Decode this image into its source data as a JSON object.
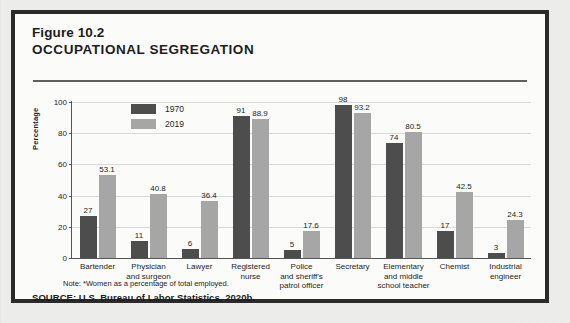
{
  "figure": {
    "number": "Figure 10.2",
    "title": "OCCUPATIONAL SEGREGATION",
    "note": "Note: *Women as a percentage of total employed.",
    "source": "SOURCE: U.S. Bureau of Labor Statistics, 2020b."
  },
  "colors": {
    "series_1970": "#4d4d4d",
    "series_2019": "#a6a6a6",
    "frame": "#2b2b2b",
    "gridline": "#d8d8d8",
    "text": "#1d1d1d",
    "panel_background": "#fbfbfa",
    "page_background": "#ececeb"
  },
  "legend": {
    "position": "inside-top-left",
    "entries": [
      {
        "label": "1970",
        "swatch": "#4d4d4d"
      },
      {
        "label": "2019",
        "swatch": "#a6a6a6"
      }
    ]
  },
  "chart_data": {
    "type": "bar",
    "title": "OCCUPATIONAL SEGREGATION",
    "subtitle": "Figure 10.2",
    "xlabel": "",
    "ylabel": "Percentage",
    "ylim": [
      0,
      100
    ],
    "yticks": [
      0,
      20,
      40,
      60,
      80,
      100
    ],
    "ytick_labels": [
      "0",
      "20",
      "40",
      "60",
      "80",
      "100"
    ],
    "grid": true,
    "grid_axis": "y",
    "legend_entries": [
      "1970",
      "2019"
    ],
    "categories": [
      "Bartender",
      "Physician and surgeon",
      "Lawyer",
      "Registered nurse",
      "Police and sheriff's patrol officer",
      "Secretary",
      "Elementary and middle school teacher",
      "Chemist",
      "Industrial engineer"
    ],
    "category_label_lines": [
      [
        "Bartender"
      ],
      [
        "Physician",
        "and surgeon"
      ],
      [
        "Lawyer"
      ],
      [
        "Registered",
        "nurse"
      ],
      [
        "Police",
        "and sheriff's",
        "patrol officer"
      ],
      [
        "Secretary"
      ],
      [
        "Elementary",
        "and middle",
        "school teacher"
      ],
      [
        "Chemist"
      ],
      [
        "Industrial",
        "engineer"
      ]
    ],
    "series": [
      {
        "name": "1970",
        "color": "#4d4d4d",
        "values": [
          27,
          11,
          6,
          91,
          5,
          98,
          74,
          17,
          3
        ],
        "labels": [
          "27",
          "11",
          "6",
          "91",
          "5",
          "98",
          "74",
          "17",
          "3"
        ]
      },
      {
        "name": "2019",
        "color": "#a6a6a6",
        "values": [
          53.1,
          40.8,
          36.4,
          88.9,
          17.6,
          93.2,
          80.5,
          42.5,
          24.3
        ],
        "labels": [
          "53.1",
          "40.8",
          "36.4",
          "88.9",
          "17.6",
          "93.2",
          "80.5",
          "42.5",
          "24.3"
        ]
      }
    ],
    "annotations": [
      "Note: *Women as a percentage of total employed.",
      "SOURCE: U.S. Bureau of Labor Statistics, 2020b."
    ]
  }
}
